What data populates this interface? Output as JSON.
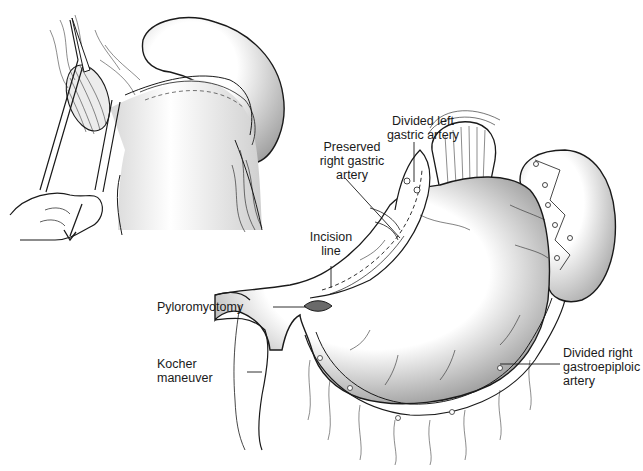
{
  "figure": {
    "panels": [
      {
        "id": "inset",
        "description": "Mobilization of the stomach with hand retraction and instrument"
      },
      {
        "id": "main",
        "description": "Stomach and spleen with vessels and labeled structures"
      }
    ],
    "labels": {
      "divided_left_gastric": {
        "line1": "Divided left",
        "line2": "gastric artery"
      },
      "preserved_right_gastric": {
        "line1": "Preserved",
        "line2": "right gastric",
        "line3": "artery"
      },
      "incision_line": {
        "line1": "Incision",
        "line2": "line"
      },
      "pyloromyotomy": {
        "line1": "Pyloromyotomy"
      },
      "kocher_maneuver": {
        "line1": "Kocher",
        "line2": "maneuver"
      },
      "divided_right_gastroepiploic": {
        "line1": "Divided right",
        "line2": "gastroepiploic",
        "line3": "artery"
      }
    },
    "colors": {
      "ink": "#1a1a1a",
      "shade": "#b5b5b5",
      "background": "#ffffff"
    }
  }
}
